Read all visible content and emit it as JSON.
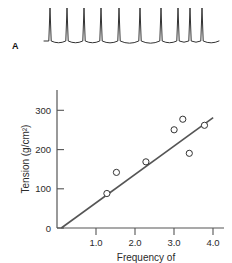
{
  "figure": {
    "panel_a_label": "A",
    "background": "#ffffff",
    "ink_color": "#333333"
  },
  "trace": {
    "name": "action-potential-train",
    "description": "spike train with decaying tails",
    "spike_count": 10,
    "spike_x": [
      50,
      67,
      84,
      101,
      119,
      140,
      161,
      178,
      190,
      202
    ],
    "baseline_y": 41,
    "peak_y": 8,
    "stroke": "#333333"
  },
  "chart_data": {
    "type": "scatter",
    "title": "",
    "xlabel": "Frequency of",
    "ylabel": "Tension (g/cm²)",
    "xlim": [
      0.45,
      4.3
    ],
    "ylim": [
      0,
      340
    ],
    "xticks": [
      1.0,
      2.0,
      3.0,
      4.0
    ],
    "xtick_labels": [
      "1.0",
      "2.0",
      "3.0",
      "4.0"
    ],
    "yticks": [
      0,
      100,
      200,
      300
    ],
    "ytick_labels": [
      "0",
      "100",
      "200",
      "300"
    ],
    "grid": false,
    "legend": null,
    "series": [
      {
        "name": "tension-vs-frequency",
        "marker": "open-circle",
        "x": [
          1.6,
          1.82,
          2.5,
          3.15,
          3.35,
          3.5,
          3.85
        ],
        "y": [
          85,
          137,
          163,
          242,
          268,
          184,
          253
        ]
      }
    ],
    "fit_line": {
      "name": "regression-line",
      "x": [
        0.55,
        4.05
      ],
      "y": [
        0,
        272
      ],
      "color": "#555555"
    }
  },
  "axis": {
    "x_label": "Frequency of",
    "y_label": "Tension (g/cm²)",
    "x_tick_1": "1.0",
    "x_tick_2": "2.0",
    "x_tick_3": "3.0",
    "x_tick_4": "4.0",
    "y_tick_0": "0",
    "y_tick_100": "100",
    "y_tick_200": "200",
    "y_tick_300": "300"
  }
}
